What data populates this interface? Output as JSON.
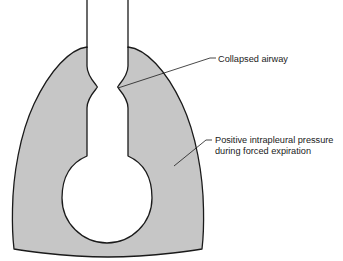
{
  "figure": {
    "background_color": "#ffffff",
    "outline_color": "#1a1a1a",
    "pleura_fill_color": "#c6c6c6",
    "airway_fill_color": "#ffffff",
    "alveolus_fill_color": "#ffffff"
  },
  "annotations": [
    {
      "id": "collapsed-airway",
      "lines": [
        "Collapsed airway"
      ],
      "text_x": 218,
      "text_y": 62,
      "leader": {
        "from_x": 118,
        "from_y": 88,
        "to_x": 210,
        "to_y": 58,
        "elbow_x": 216,
        "elbow_y": 58
      }
    },
    {
      "id": "positive-intrapleural-pressure",
      "lines": [
        "Positive intrapleural pressure",
        "during forced expiration"
      ],
      "text_x": 215,
      "text_y": 143,
      "line_height": 10.5,
      "leader": {
        "from_x": 174,
        "from_y": 166,
        "to_x": 206,
        "to_y": 140,
        "elbow_x": 212,
        "elbow_y": 140
      }
    }
  ],
  "geometry": {
    "trachea_left_x": 87,
    "trachea_right_x": 128,
    "pinch_x": 117,
    "pinch_y": 87,
    "alveolus_center_x": 107,
    "alveolus_center_y": 198,
    "alveolus_radius": 45,
    "lung_left_extent": 12,
    "lung_right_extent": 205,
    "lung_apex_y": 46,
    "lung_base_y": 251
  }
}
